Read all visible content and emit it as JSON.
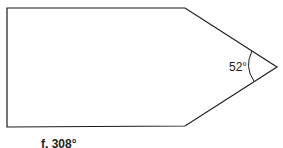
{
  "diagram": {
    "shape": "pentagon (arrow/house shape)",
    "vertices": [
      [
        7,
        8
      ],
      [
        185,
        8
      ],
      [
        277,
        67
      ],
      [
        185,
        126
      ],
      [
        7,
        127
      ]
    ],
    "stroke_color": "#1a1a1a",
    "angle": {
      "vertex": "tip",
      "label": "52°",
      "value_degrees": 52
    }
  },
  "caption": {
    "text": "f. 308°"
  }
}
